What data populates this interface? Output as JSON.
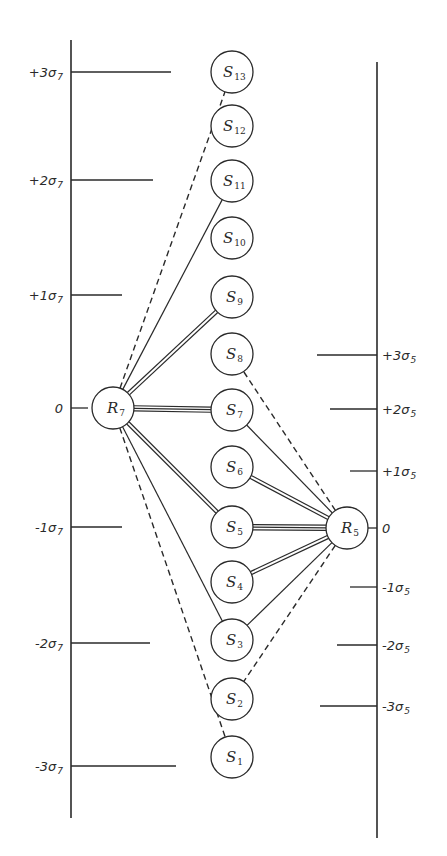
{
  "diagram": {
    "title": "",
    "colors": {
      "ink": "#2a2a2a",
      "background": "#ffffff"
    },
    "left_axis": {
      "name": "R7 scale",
      "x": 71,
      "y_top": 40,
      "y_bottom": 818,
      "ticks": [
        {
          "label": "+3σ",
          "sub": "7",
          "y": 72,
          "x_end": 171
        },
        {
          "label": "+2σ",
          "sub": "7",
          "y": 180,
          "x_end": 153
        },
        {
          "label": "+1σ",
          "sub": "7",
          "y": 295,
          "x_end": 122
        },
        {
          "label": "0",
          "sub": "",
          "y": 408,
          "x_end": 88
        },
        {
          "label": "-1σ",
          "sub": "7",
          "y": 527,
          "x_end": 122
        },
        {
          "label": "-2σ",
          "sub": "7",
          "y": 643,
          "x_end": 150
        },
        {
          "label": "-3σ",
          "sub": "7",
          "y": 766,
          "x_end": 176
        }
      ]
    },
    "right_axis": {
      "name": "R5 scale",
      "x": 377,
      "y_top": 62,
      "y_bottom": 838,
      "ticks": [
        {
          "label": "+3σ",
          "sub": "5",
          "y": 355,
          "x_start": 317
        },
        {
          "label": "+2σ",
          "sub": "5",
          "y": 409,
          "x_start": 330
        },
        {
          "label": "+1σ",
          "sub": "5",
          "y": 471,
          "x_start": 350
        },
        {
          "label": "0",
          "sub": "",
          "y": 528,
          "x_start": 366
        },
        {
          "label": "-1σ",
          "sub": "5",
          "y": 587,
          "x_start": 350
        },
        {
          "label": "-2σ",
          "sub": "5",
          "y": 645,
          "x_start": 337
        },
        {
          "label": "-3σ",
          "sub": "5",
          "y": 706,
          "x_start": 320
        }
      ]
    },
    "nodes": [
      {
        "id": "S13",
        "letter": "S",
        "sub": "13",
        "x": 232,
        "y": 72
      },
      {
        "id": "S12",
        "letter": "S",
        "sub": "12",
        "x": 232,
        "y": 126
      },
      {
        "id": "S11",
        "letter": "S",
        "sub": "11",
        "x": 232,
        "y": 181
      },
      {
        "id": "S10",
        "letter": "S",
        "sub": "10",
        "x": 232,
        "y": 238
      },
      {
        "id": "S9",
        "letter": "S",
        "sub": "9",
        "x": 232,
        "y": 297
      },
      {
        "id": "S8",
        "letter": "S",
        "sub": "8",
        "x": 232,
        "y": 354
      },
      {
        "id": "S7",
        "letter": "S",
        "sub": "7",
        "x": 232,
        "y": 410
      },
      {
        "id": "S6",
        "letter": "S",
        "sub": "6",
        "x": 232,
        "y": 467
      },
      {
        "id": "S5",
        "letter": "S",
        "sub": "5",
        "x": 232,
        "y": 527
      },
      {
        "id": "S4",
        "letter": "S",
        "sub": "4",
        "x": 232,
        "y": 582
      },
      {
        "id": "S3",
        "letter": "S",
        "sub": "3",
        "x": 232,
        "y": 640
      },
      {
        "id": "S2",
        "letter": "S",
        "sub": "2",
        "x": 232,
        "y": 699
      },
      {
        "id": "S1",
        "letter": "S",
        "sub": "1",
        "x": 232,
        "y": 757
      },
      {
        "id": "R7",
        "letter": "R",
        "sub": "7",
        "x": 113,
        "y": 408
      },
      {
        "id": "R5",
        "letter": "R",
        "sub": "5",
        "x": 347,
        "y": 528
      }
    ],
    "node_radius": 21,
    "edges": [
      {
        "from": "R7",
        "to": "S13",
        "style": "dashed"
      },
      {
        "from": "R7",
        "to": "S11",
        "style": "single"
      },
      {
        "from": "R7",
        "to": "S9",
        "style": "double"
      },
      {
        "from": "R7",
        "to": "S7",
        "style": "triple"
      },
      {
        "from": "R7",
        "to": "S5",
        "style": "double"
      },
      {
        "from": "R7",
        "to": "S3",
        "style": "single"
      },
      {
        "from": "R7",
        "to": "S1",
        "style": "dashed"
      },
      {
        "from": "R5",
        "to": "S8",
        "style": "dashed"
      },
      {
        "from": "R5",
        "to": "S7",
        "style": "single"
      },
      {
        "from": "R5",
        "to": "S6",
        "style": "double"
      },
      {
        "from": "R5",
        "to": "S5",
        "style": "triple"
      },
      {
        "from": "R5",
        "to": "S4",
        "style": "double"
      },
      {
        "from": "R5",
        "to": "S3",
        "style": "single"
      },
      {
        "from": "R5",
        "to": "S2",
        "style": "dashed"
      }
    ]
  }
}
